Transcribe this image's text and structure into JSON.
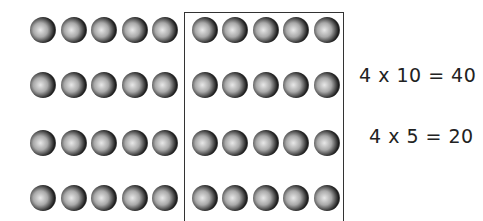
{
  "diagram": {
    "rows": 4,
    "left_group_columns": 5,
    "right_group_columns": 5,
    "equations": [
      {
        "text": "4 x 10 = 40"
      },
      {
        "text": "4 x 5 = 20"
      }
    ]
  }
}
